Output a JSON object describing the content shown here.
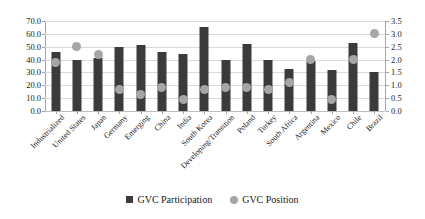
{
  "chart_data": {
    "type": "bar",
    "title": "",
    "subtitle": "",
    "xlabel": "",
    "ylabel": "",
    "y2label": "",
    "grid": true,
    "legend_position": "bottom",
    "ylim": [
      0,
      70
    ],
    "y2lim": [
      0,
      3.5
    ],
    "ytick_step": 10,
    "y2tick_step": 0.5,
    "yticks": [
      "0.0",
      "10.0",
      "20.0",
      "30.0",
      "40.0",
      "50.0",
      "60.0",
      "70.0"
    ],
    "y2ticks": [
      "0.0",
      "0.5",
      "1.0",
      "1.5",
      "2.0",
      "2.5",
      "3.0",
      "3.5"
    ],
    "categories": [
      "Industrialized",
      "United States",
      "Japan",
      "Germany",
      "Emerging",
      "China",
      "India",
      "South Korea",
      "Developing/Transition",
      "Poland",
      "Turkey",
      "South Africa",
      "Argentina",
      "Mexico",
      "Chile",
      "Brazil"
    ],
    "series": [
      {
        "name": "GVC Participation",
        "axis": "left",
        "mark": "bar",
        "color": "#3b3b3b",
        "values": [
          46.0,
          40.0,
          41.0,
          50.0,
          51.0,
          46.0,
          44.0,
          65.0,
          40.0,
          52.0,
          40.0,
          33.0,
          39.0,
          32.0,
          53.0,
          30.0
        ]
      },
      {
        "name": "GVC Position",
        "axis": "right",
        "mark": "circle",
        "color": "#a6a6a6",
        "values": [
          1.9,
          2.5,
          2.2,
          0.85,
          0.65,
          0.9,
          0.45,
          0.85,
          0.9,
          0.9,
          0.85,
          1.1,
          2.0,
          0.45,
          2.0,
          3.0
        ]
      }
    ]
  },
  "legend": {
    "items": [
      {
        "label": "GVC Participation",
        "marker": "square-dark"
      },
      {
        "label": "GVC Position",
        "marker": "circle-gray"
      }
    ]
  }
}
